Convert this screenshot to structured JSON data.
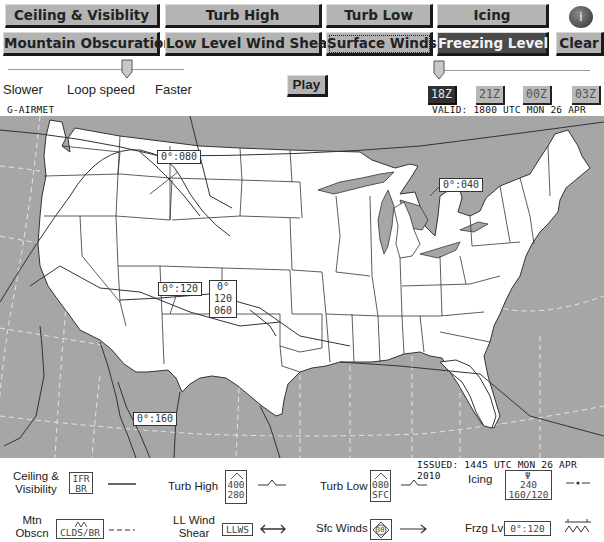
{
  "toolbar": {
    "row1": [
      {
        "label": "Ceiling & Visiblity",
        "state": "normal"
      },
      {
        "label": "Turb High",
        "state": "normal"
      },
      {
        "label": "Turb Low",
        "state": "normal"
      },
      {
        "label": "Icing",
        "state": "normal"
      }
    ],
    "row2": [
      {
        "label": "Mountain Obscuration",
        "state": "normal"
      },
      {
        "label": "Low Level Wind Shear",
        "state": "normal"
      },
      {
        "label": "Surface Winds",
        "state": "selected"
      },
      {
        "label": "Freezing Level",
        "state": "active"
      },
      {
        "label": "Clear",
        "state": "normal"
      }
    ],
    "help_icon": "info-icon",
    "help_glyph": "i"
  },
  "loop_speed": {
    "slower_label": "Slower",
    "title_label": "Loop speed",
    "faster_label": "Faster",
    "position_percent": 67
  },
  "play_label": "Play",
  "time_slider": {
    "position_percent": 0
  },
  "times": [
    {
      "label": "18Z",
      "active": true
    },
    {
      "label": "21Z",
      "active": false
    },
    {
      "label": "00Z",
      "active": false
    },
    {
      "label": "03Z",
      "active": false
    }
  ],
  "product_title": "G-AIRMET",
  "valid_text": "VALID: 1800 UTC MON 26 APR 2010",
  "issued_text": "ISSUED: 1445 UTC MON 26 APR 2010",
  "map": {
    "colors": {
      "water": "#a6a6a6",
      "land": "#ffffff",
      "lines": "#333333"
    },
    "freezing_levels": [
      {
        "text": "0°:080"
      },
      {
        "text": "0°:040"
      },
      {
        "text": "0°:120"
      },
      {
        "text_lines": [
          "0°",
          "120",
          "060"
        ]
      },
      {
        "text": "0°:160"
      }
    ]
  },
  "legend": {
    "items": [
      {
        "label": "Ceiling & Visibility",
        "box_lines": [
          "IFR",
          "BR"
        ],
        "line_style": "solid"
      },
      {
        "label": "Turb High",
        "box_lines": [
          "400",
          "280"
        ],
        "line_style": "turbulence"
      },
      {
        "label": "Turb Low",
        "box_lines": [
          "080",
          "SFC"
        ],
        "line_style": "turbulence"
      },
      {
        "label": "Icing",
        "box_lines": [
          "240",
          "160/120"
        ],
        "line_style": "dash-dot"
      },
      {
        "label": "Mtn Obscn",
        "box_lines": [
          "CLDS/BR"
        ],
        "line_style": "dashed"
      },
      {
        "label": "LL Wind Shear",
        "box_lines": [
          "LLWS"
        ],
        "line_style": "double-arrow"
      },
      {
        "label": "Sfc Winds",
        "box_lines": [
          "30"
        ],
        "line_style": "arrow"
      },
      {
        "label": "Frzg Lvl",
        "box_lines": [
          "0°:120"
        ],
        "line_style": "freezing"
      }
    ]
  }
}
